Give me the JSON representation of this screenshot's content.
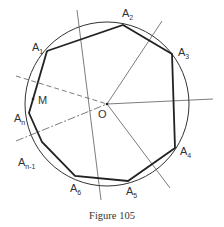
{
  "figure": {
    "caption": "Figure 105",
    "center": {
      "label": "O",
      "x": 107,
      "y": 104
    },
    "circle": {
      "cx": 107,
      "cy": 104,
      "r": 82
    },
    "vertices": [
      {
        "id": "A1",
        "base": "A",
        "sub": "1",
        "x": 47,
        "y": 51,
        "lx": 32,
        "ly": 51
      },
      {
        "id": "A2",
        "base": "A",
        "sub": "2",
        "x": 123,
        "y": 25,
        "lx": 122,
        "ly": 17
      },
      {
        "id": "A3",
        "base": "A",
        "sub": "3",
        "x": 172,
        "y": 54,
        "lx": 178,
        "ly": 56
      },
      {
        "id": "A4",
        "base": "A",
        "sub": "4",
        "x": 175,
        "y": 148,
        "lx": 180,
        "ly": 155
      },
      {
        "id": "A5",
        "base": "A",
        "sub": "5",
        "x": 128,
        "y": 181,
        "lx": 126,
        "ly": 195
      },
      {
        "id": "A6",
        "base": "A",
        "sub": "6",
        "x": 75,
        "y": 176,
        "lx": 70,
        "ly": 192
      },
      {
        "id": "An-1",
        "base": "A",
        "sub": "n-1",
        "x": 42,
        "y": 142,
        "lx": 18,
        "ly": 166
      },
      {
        "id": "An",
        "base": "A",
        "sub": "n",
        "x": 29,
        "y": 113,
        "lx": 14,
        "ly": 122
      }
    ],
    "point_m": {
      "label": "M",
      "x": 33,
      "y": 99,
      "lx": 38,
      "ly": 104
    },
    "rays": [
      {
        "x1": 77,
        "y1": 10,
        "x2": 101,
        "y2": 200,
        "style": "solid"
      },
      {
        "x1": 107,
        "y1": 104,
        "x2": 162,
        "y2": 21,
        "style": "solid"
      },
      {
        "x1": 107,
        "y1": 104,
        "x2": 213,
        "y2": 99,
        "style": "solid"
      },
      {
        "x1": 107,
        "y1": 104,
        "x2": 170,
        "y2": 188,
        "style": "solid"
      },
      {
        "x1": 16,
        "y1": 76,
        "x2": 107,
        "y2": 104,
        "style": "dashed"
      },
      {
        "x1": 16,
        "y1": 141,
        "x2": 107,
        "y2": 104,
        "style": "dashdot"
      }
    ],
    "colors": {
      "stroke": "#333333",
      "background": "#ffffff"
    }
  }
}
